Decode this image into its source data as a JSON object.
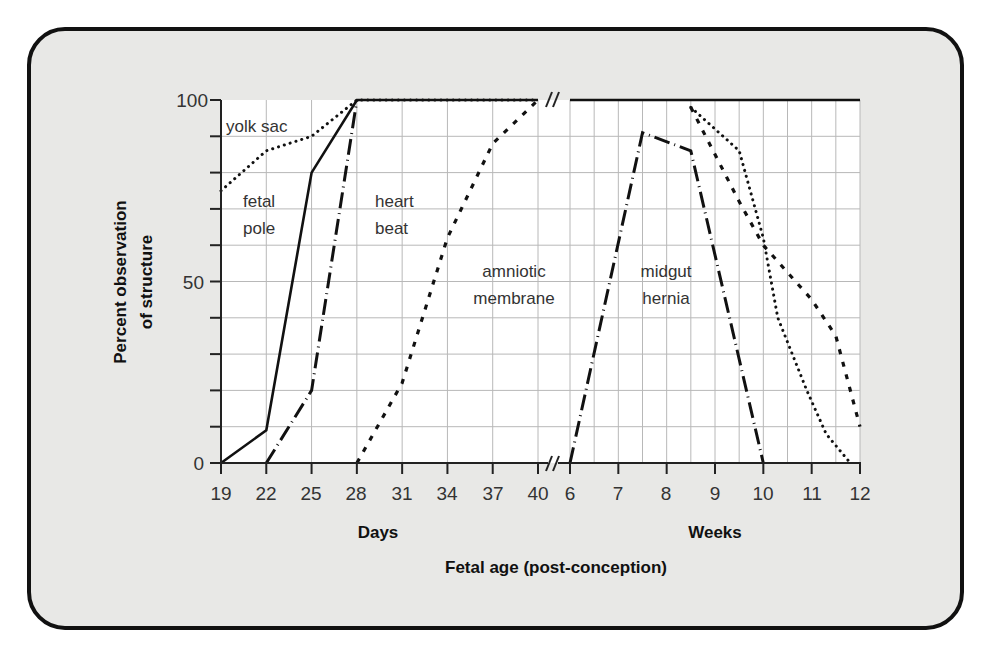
{
  "chart_data": {
    "type": "line",
    "title": "",
    "ylabel": "Percent observation of structure",
    "ylabel_lines": [
      "Percent observation",
      "of structure"
    ],
    "xlabel": "Fetal age (post-conception)",
    "x_segments": [
      {
        "name": "Days",
        "ticks": [
          19,
          22,
          25,
          28,
          31,
          34,
          37,
          40
        ],
        "range": [
          19,
          40
        ]
      },
      {
        "name": "Weeks",
        "ticks": [
          6,
          7,
          8,
          9,
          10,
          11,
          12
        ],
        "range": [
          6,
          12
        ]
      }
    ],
    "ylim": [
      0,
      100
    ],
    "yticks": [
      0,
      50,
      100
    ],
    "grid": true,
    "axis_break": "between 40 days and 6 weeks",
    "series": [
      {
        "name": "yolk sac",
        "style": "dotted",
        "segment": "Days",
        "points": [
          [
            19,
            75
          ],
          [
            22,
            86
          ],
          [
            25,
            90
          ],
          [
            28,
            100
          ],
          [
            40,
            100
          ]
        ]
      },
      {
        "name": "yolk sac",
        "style": "dotted",
        "segment": "Weeks",
        "points": [
          [
            8.5,
            98
          ],
          [
            9.5,
            86
          ],
          [
            10,
            62
          ],
          [
            10.3,
            40
          ],
          [
            10.9,
            20
          ],
          [
            11.3,
            8
          ],
          [
            11.8,
            0
          ]
        ]
      },
      {
        "name": "fetal pole",
        "style": "solid",
        "segment": "Days",
        "points": [
          [
            19,
            0
          ],
          [
            22,
            9
          ],
          [
            25,
            80
          ],
          [
            28,
            100
          ],
          [
            40,
            100
          ]
        ]
      },
      {
        "name": "fetal pole",
        "style": "solid",
        "segment": "Weeks",
        "points": [
          [
            6,
            100
          ],
          [
            12,
            100
          ]
        ]
      },
      {
        "name": "heart beat",
        "style": "dash-dot",
        "segment": "Days",
        "points": [
          [
            22,
            0
          ],
          [
            25,
            20
          ],
          [
            28,
            100
          ]
        ]
      },
      {
        "name": "amniotic membrane",
        "style": "dashed",
        "segment": "Days",
        "points": [
          [
            28,
            0
          ],
          [
            31,
            22
          ],
          [
            34,
            62
          ],
          [
            37,
            88
          ],
          [
            40,
            100
          ]
        ]
      },
      {
        "name": "amniotic membrane",
        "style": "dashed",
        "segment": "Weeks",
        "points": [
          [
            8.5,
            98
          ],
          [
            9.5,
            72
          ],
          [
            10,
            60
          ],
          [
            11,
            45
          ],
          [
            11.5,
            35
          ],
          [
            12,
            10
          ]
        ]
      },
      {
        "name": "midgut hernia",
        "style": "dash-dot",
        "segment": "Weeks",
        "points": [
          [
            6,
            0
          ],
          [
            7.5,
            91
          ],
          [
            8.5,
            86
          ],
          [
            10,
            0
          ]
        ]
      }
    ],
    "annotations": [
      "yolk sac",
      "fetal pole",
      "heart beat",
      "amniotic membrane",
      "midgut hernia"
    ]
  },
  "labels": {
    "y_axis_line1": "Percent observation",
    "y_axis_line2": "of structure",
    "x_days": "Days",
    "x_weeks": "Weeks",
    "x_title": "Fetal age (post-conception)",
    "y_ticks": [
      "0",
      "50",
      "100"
    ],
    "day_ticks": [
      "19",
      "22",
      "25",
      "28",
      "31",
      "34",
      "37",
      "40"
    ],
    "week_ticks": [
      "6",
      "7",
      "8",
      "9",
      "10",
      "11",
      "12"
    ],
    "ann_yolk": "yolk sac",
    "ann_fetal1": "fetal",
    "ann_fetal2": "pole",
    "ann_heart1": "heart",
    "ann_heart2": "beat",
    "ann_amn1": "amniotic",
    "ann_amn2": "membrane",
    "ann_mid1": "midgut",
    "ann_mid2": "hernia"
  }
}
